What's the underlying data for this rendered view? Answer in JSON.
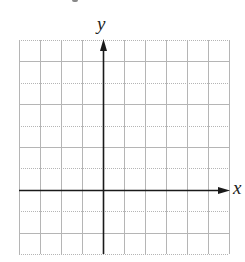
{
  "chart_data": {
    "type": "coordinate-grid",
    "title": "",
    "xlabel": "x",
    "ylabel": "y",
    "grid": true,
    "columns": 10,
    "rows": 10,
    "x_range": [
      -4,
      6
    ],
    "y_range": [
      -3,
      7
    ],
    "y_axis_column": 4,
    "x_axis_row_from_top": 7,
    "tick_labels": [],
    "series": [],
    "colors": {
      "grid": "#b5b5b5",
      "axis": "#1a1a1a",
      "background": "#ffffff"
    }
  },
  "labels": {
    "x_axis": "x",
    "y_axis": "y"
  }
}
